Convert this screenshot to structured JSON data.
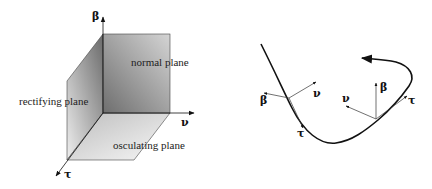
{
  "left_diagram": {
    "axes": {
      "beta": "β",
      "nu": "ν",
      "tau": "τ"
    },
    "planes": {
      "normal": "normal plane",
      "rectifying": "rectifying plane",
      "osculating": "osculating plane"
    }
  },
  "right_diagram": {
    "frame1": {
      "beta": "β",
      "nu": "ν",
      "tau": "τ"
    },
    "frame2": {
      "beta": "β",
      "nu": "ν",
      "tau": "τ"
    }
  },
  "colors": {
    "plane_dark": "#7a7a7a",
    "plane_light": "#f0f0f0",
    "stroke": "#111111"
  }
}
